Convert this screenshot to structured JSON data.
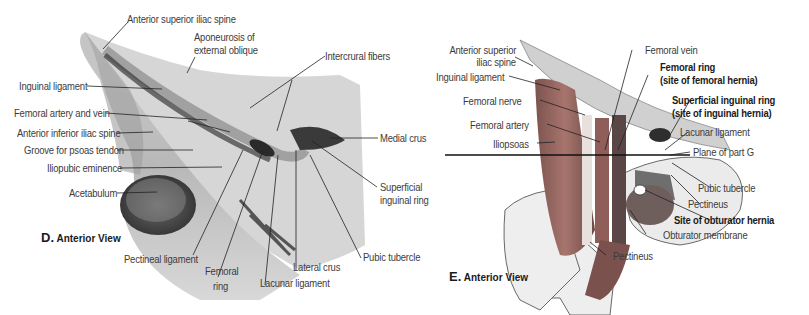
{
  "panel_d": {
    "caption_letter": "D.",
    "caption_text": "Anterior View",
    "labels": {
      "asis": "Anterior superior iliac spine",
      "aponeurosis_1": "Aponeurosis of",
      "aponeurosis_2": "external oblique",
      "intercrural": "Intercrural fibers",
      "inguinal_lig": "Inguinal ligament",
      "fem_art_vein": "Femoral artery and vein",
      "aiis": "Anterior inferior iliac spine",
      "groove_psoas": "Groove for psoas tendon",
      "iliopubic": "Iliopubic eminence",
      "acetabulum": "Acetabulum",
      "medial_crus": "Medial crus",
      "superficial_ring_1": "Superficial",
      "superficial_ring_2": "inguinal ring",
      "pubic_tubercle": "Pubic tubercle",
      "pectineal_lig": "Pectineal ligament",
      "femoral_ring_1": "Femoral",
      "femoral_ring_2": "ring",
      "lateral_crus": "Lateral crus",
      "lacunar_lig": "Lacunar ligament"
    }
  },
  "panel_e": {
    "caption_letter": "E.",
    "caption_text": "Anterior View",
    "labels": {
      "asis_1": "Anterior superior",
      "asis_2": "iliac spine",
      "inguinal_lig": "Inguinal ligament",
      "femoral_nerve": "Femoral nerve",
      "femoral_artery": "Femoral artery",
      "iliopsoas": "Iliopsoas",
      "femoral_vein": "Femoral vein",
      "femoral_ring_1": "Femoral ring",
      "femoral_ring_2": "(site of femoral hernia)",
      "sup_ring_1": "Superficial inguinal ring",
      "sup_ring_2": "(site of inguinal hernia)",
      "lacunar_lig": "Lacunar ligament",
      "plane_g": "Plane of part G",
      "pubic_tubercle": "Pubic tubercle",
      "pectineus_upper": "Pectineus",
      "obturator_site": "Site of obturator hernia",
      "obturator_membrane": "Obturator membrane",
      "pectineus_lower": "Pectineus"
    }
  },
  "colors": {
    "bone": "#e6e6e6",
    "muscle": "#9a6a64",
    "shadow": "#4a4a4a",
    "leader": "#222222"
  }
}
